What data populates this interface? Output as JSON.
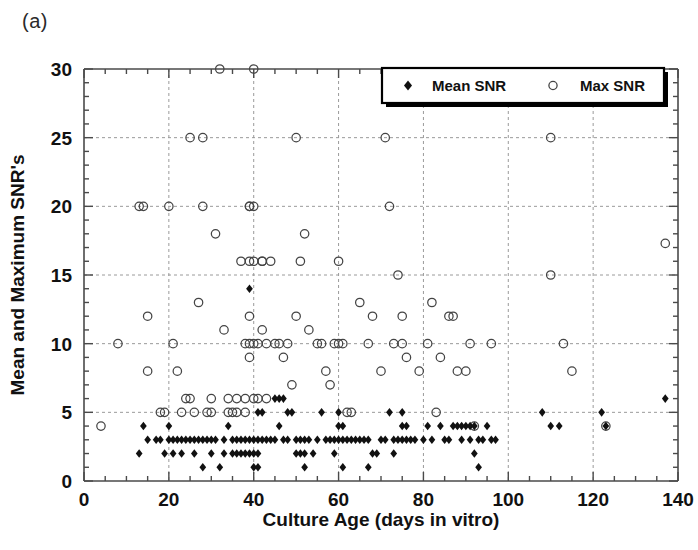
{
  "panel": {
    "label": "(a)"
  },
  "chart_data": {
    "type": "scatter",
    "title": "",
    "xlabel": "Culture Age (days in vitro)",
    "ylabel": "Mean and Maximum SNR's",
    "xlim": [
      0,
      140
    ],
    "ylim": [
      0,
      30
    ],
    "xticks": [
      0,
      20,
      40,
      60,
      80,
      100,
      120,
      140
    ],
    "yticks": [
      0,
      5,
      10,
      15,
      20,
      25,
      30
    ],
    "xtick_labels": [
      "0",
      "20",
      "40",
      "60",
      "80",
      "100",
      "120",
      "140"
    ],
    "ytick_labels": [
      "0",
      "5",
      "10",
      "15",
      "20",
      "25",
      "30"
    ],
    "x_minor_interval": 5,
    "y_minor_interval": 1,
    "grid": true,
    "grid_style": "dashed",
    "legend_position": "top-right",
    "series": [
      {
        "name": "Mean SNR",
        "marker": "filled-diamond",
        "color": "#111111",
        "points": [
          [
            13,
            2
          ],
          [
            14,
            4
          ],
          [
            15,
            3
          ],
          [
            17,
            3
          ],
          [
            18,
            3
          ],
          [
            19,
            2
          ],
          [
            20,
            3
          ],
          [
            20,
            4
          ],
          [
            21,
            3
          ],
          [
            21,
            2
          ],
          [
            22,
            3
          ],
          [
            23,
            3
          ],
          [
            23,
            2
          ],
          [
            24,
            3
          ],
          [
            25,
            3
          ],
          [
            26,
            3
          ],
          [
            26,
            2
          ],
          [
            27,
            3
          ],
          [
            28,
            3
          ],
          [
            28,
            1
          ],
          [
            29,
            3
          ],
          [
            30,
            3
          ],
          [
            30,
            2
          ],
          [
            31,
            3
          ],
          [
            32,
            1
          ],
          [
            33,
            3
          ],
          [
            33,
            2
          ],
          [
            34,
            4
          ],
          [
            35,
            3
          ],
          [
            35,
            2
          ],
          [
            36,
            3
          ],
          [
            36,
            2
          ],
          [
            37,
            3
          ],
          [
            37,
            2
          ],
          [
            38,
            3
          ],
          [
            38,
            2
          ],
          [
            39,
            3
          ],
          [
            39,
            2
          ],
          [
            39,
            14
          ],
          [
            40,
            3
          ],
          [
            40,
            2
          ],
          [
            40,
            1
          ],
          [
            41,
            5
          ],
          [
            41,
            3
          ],
          [
            41,
            2
          ],
          [
            41,
            1
          ],
          [
            42,
            5
          ],
          [
            42,
            3
          ],
          [
            43,
            3
          ],
          [
            44,
            3
          ],
          [
            45,
            6
          ],
          [
            45,
            3
          ],
          [
            46,
            6
          ],
          [
            46,
            4
          ],
          [
            47,
            6
          ],
          [
            47,
            3
          ],
          [
            48,
            5
          ],
          [
            48,
            3
          ],
          [
            49,
            5
          ],
          [
            50,
            3
          ],
          [
            50,
            2
          ],
          [
            51,
            3
          ],
          [
            51,
            2
          ],
          [
            52,
            3
          ],
          [
            52,
            2
          ],
          [
            52,
            1
          ],
          [
            53,
            3
          ],
          [
            54,
            2
          ],
          [
            55,
            3
          ],
          [
            56,
            5
          ],
          [
            57,
            3
          ],
          [
            58,
            3
          ],
          [
            59,
            3
          ],
          [
            59,
            2
          ],
          [
            60,
            5
          ],
          [
            60,
            4
          ],
          [
            60,
            3
          ],
          [
            61,
            4
          ],
          [
            61,
            3
          ],
          [
            61,
            1
          ],
          [
            62,
            3
          ],
          [
            63,
            3
          ],
          [
            64,
            3
          ],
          [
            65,
            3
          ],
          [
            66,
            3
          ],
          [
            67,
            3
          ],
          [
            67,
            1
          ],
          [
            68,
            2
          ],
          [
            69,
            2
          ],
          [
            70,
            3
          ],
          [
            71,
            3
          ],
          [
            72,
            5
          ],
          [
            73,
            3
          ],
          [
            73,
            2
          ],
          [
            74,
            3
          ],
          [
            75,
            5
          ],
          [
            75,
            4
          ],
          [
            75,
            3
          ],
          [
            76,
            4
          ],
          [
            76,
            3
          ],
          [
            77,
            3
          ],
          [
            78,
            3
          ],
          [
            80,
            3
          ],
          [
            81,
            4
          ],
          [
            82,
            3
          ],
          [
            84,
            4
          ],
          [
            85,
            3
          ],
          [
            86,
            3
          ],
          [
            87,
            4
          ],
          [
            88,
            4
          ],
          [
            89,
            4
          ],
          [
            89,
            3
          ],
          [
            90,
            4
          ],
          [
            91,
            4
          ],
          [
            91,
            3
          ],
          [
            92,
            4
          ],
          [
            92,
            2
          ],
          [
            93,
            3
          ],
          [
            93,
            1
          ],
          [
            94,
            3
          ],
          [
            95,
            4
          ],
          [
            96,
            3
          ],
          [
            97,
            3
          ],
          [
            108,
            5
          ],
          [
            110,
            4
          ],
          [
            112,
            4
          ],
          [
            122,
            5
          ],
          [
            123,
            4
          ],
          [
            137,
            6
          ]
        ]
      },
      {
        "name": "Max SNR",
        "marker": "open-circle",
        "color": "#444444",
        "points": [
          [
            4,
            4
          ],
          [
            8,
            10
          ],
          [
            13,
            20
          ],
          [
            14,
            20
          ],
          [
            15,
            12
          ],
          [
            15,
            8
          ],
          [
            18,
            5
          ],
          [
            19,
            5
          ],
          [
            20,
            20
          ],
          [
            21,
            10
          ],
          [
            22,
            8
          ],
          [
            23,
            5
          ],
          [
            24,
            6
          ],
          [
            25,
            25
          ],
          [
            25,
            6
          ],
          [
            26,
            5
          ],
          [
            27,
            13
          ],
          [
            28,
            25
          ],
          [
            28,
            20
          ],
          [
            29,
            5
          ],
          [
            30,
            6
          ],
          [
            30,
            5
          ],
          [
            31,
            18
          ],
          [
            32,
            30
          ],
          [
            33,
            11
          ],
          [
            34,
            6
          ],
          [
            34,
            5
          ],
          [
            35,
            5
          ],
          [
            36,
            6
          ],
          [
            36,
            5
          ],
          [
            37,
            16
          ],
          [
            38,
            10
          ],
          [
            38,
            6
          ],
          [
            38,
            5
          ],
          [
            39,
            20
          ],
          [
            39,
            20
          ],
          [
            39,
            16
          ],
          [
            39,
            12
          ],
          [
            39,
            10
          ],
          [
            39,
            9
          ],
          [
            40,
            30
          ],
          [
            40,
            20
          ],
          [
            40,
            16
          ],
          [
            40,
            10
          ],
          [
            40,
            6
          ],
          [
            41,
            10
          ],
          [
            41,
            6
          ],
          [
            42,
            16
          ],
          [
            42,
            16
          ],
          [
            42,
            11
          ],
          [
            43,
            10
          ],
          [
            43,
            6
          ],
          [
            44,
            16
          ],
          [
            45,
            10
          ],
          [
            46,
            10
          ],
          [
            47,
            9
          ],
          [
            48,
            10
          ],
          [
            49,
            7
          ],
          [
            50,
            25
          ],
          [
            50,
            12
          ],
          [
            51,
            16
          ],
          [
            52,
            18
          ],
          [
            53,
            11
          ],
          [
            55,
            10
          ],
          [
            56,
            10
          ],
          [
            57,
            8
          ],
          [
            58,
            7
          ],
          [
            59,
            10
          ],
          [
            60,
            16
          ],
          [
            60,
            10
          ],
          [
            61,
            10
          ],
          [
            62,
            5
          ],
          [
            63,
            5
          ],
          [
            65,
            13
          ],
          [
            67,
            10
          ],
          [
            68,
            12
          ],
          [
            70,
            8
          ],
          [
            71,
            25
          ],
          [
            72,
            20
          ],
          [
            73,
            10
          ],
          [
            74,
            15
          ],
          [
            75,
            12
          ],
          [
            75,
            10
          ],
          [
            76,
            9
          ],
          [
            79,
            8
          ],
          [
            81,
            10
          ],
          [
            82,
            13
          ],
          [
            83,
            5
          ],
          [
            84,
            9
          ],
          [
            86,
            12
          ],
          [
            87,
            12
          ],
          [
            88,
            8
          ],
          [
            90,
            8
          ],
          [
            91,
            10
          ],
          [
            92,
            4
          ],
          [
            96,
            10
          ],
          [
            110,
            25
          ],
          [
            110,
            15
          ],
          [
            113,
            10
          ],
          [
            115,
            8
          ],
          [
            123,
            4
          ],
          [
            137,
            17.3
          ]
        ]
      }
    ]
  },
  "legend": {
    "entries": [
      {
        "label": "Mean SNR",
        "marker": "filled-diamond"
      },
      {
        "label": "Max SNR",
        "marker": "open-circle"
      }
    ]
  }
}
